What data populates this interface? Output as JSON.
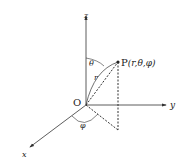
{
  "diagram": {
    "type": "spherical-coordinates",
    "axes": {
      "z": "z",
      "y": "y",
      "x": "x"
    },
    "origin_label": "O",
    "point_label": "P",
    "point_coords": "(r,θ,φ)",
    "radius_label": "r",
    "polar_angle_label": "θ",
    "azimuth_angle_label": "φ",
    "colors": {
      "line": "#333333",
      "background": "#ffffff"
    }
  }
}
